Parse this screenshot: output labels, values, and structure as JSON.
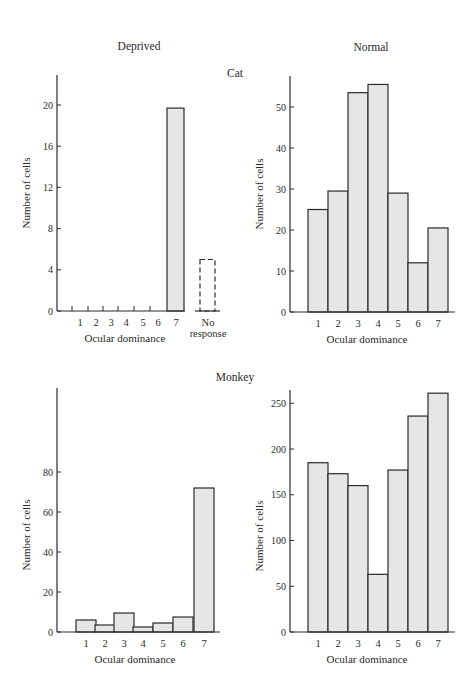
{
  "figure": {
    "column_titles": [
      "Deprived",
      "Normal"
    ],
    "row_labels": [
      "Cat",
      "Monkey"
    ],
    "bar_fill": "#e6e6e6",
    "bar_stroke": "#2a2a2a"
  },
  "chart_data": [
    {
      "type": "bar",
      "title": "Cat — Deprived",
      "xlabel": "Ocular dominance",
      "ylabel": "Number of cells",
      "categories": [
        "1",
        "2",
        "3",
        "4",
        "5",
        "6",
        "7"
      ],
      "values": [
        0,
        0,
        0,
        0,
        0,
        0,
        19.7
      ],
      "extra_category": {
        "label": "No response",
        "value": 5,
        "style": "dashed"
      },
      "yticks": [
        0,
        4,
        8,
        12,
        16,
        20
      ],
      "ylim": [
        0,
        23
      ]
    },
    {
      "type": "bar",
      "title": "Cat — Normal",
      "xlabel": "Ocular dominance",
      "ylabel": "Number of cells",
      "categories": [
        "1",
        "2",
        "3",
        "4",
        "5",
        "6",
        "7"
      ],
      "values": [
        25,
        29.5,
        53.5,
        55.5,
        29,
        12,
        20.5
      ],
      "yticks": [
        0,
        10,
        20,
        30,
        40,
        50
      ],
      "ylim": [
        0,
        57
      ]
    },
    {
      "type": "bar",
      "title": "Monkey — Deprived",
      "xlabel": "Ocular dominance",
      "ylabel": "Number of cells",
      "categories": [
        "1",
        "2",
        "3",
        "4",
        "5",
        "6",
        "7"
      ],
      "values": [
        6,
        3.5,
        9.5,
        2.5,
        4.5,
        7.5,
        72
      ],
      "yticks": [
        0,
        20,
        40,
        60,
        80
      ],
      "ylim": [
        0,
        122
      ]
    },
    {
      "type": "bar",
      "title": "Monkey — Normal",
      "xlabel": "Ocular dominance",
      "ylabel": "Number of cells",
      "categories": [
        "1",
        "2",
        "3",
        "4",
        "5",
        "6",
        "7"
      ],
      "values": [
        185,
        173,
        160,
        63,
        177,
        236,
        261
      ],
      "yticks": [
        0,
        50,
        100,
        150,
        200,
        250
      ],
      "ylim": [
        0,
        265
      ]
    }
  ]
}
